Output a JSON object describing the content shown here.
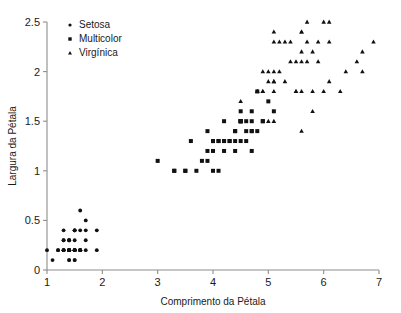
{
  "chart_data": {
    "type": "scatter",
    "title": "",
    "xlabel": "Comprimento da Pétala",
    "ylabel": "Largura da Pétala",
    "xlim": [
      1,
      7
    ],
    "ylim": [
      0,
      2.5
    ],
    "xticks": [
      1,
      2,
      3,
      4,
      5,
      6,
      7
    ],
    "yticks": [
      0,
      0.5,
      1,
      1.5,
      2,
      2.5
    ],
    "xtick_labels": [
      "1",
      "2",
      "3",
      "4",
      "5",
      "6",
      "7"
    ],
    "ytick_labels": [
      "0",
      "0.5",
      "1",
      "1.5",
      "2",
      "2.5"
    ],
    "grid": false,
    "legend_position": "top-left",
    "marker_color": "#111111",
    "axis_color": "#8d8d8d",
    "series": [
      {
        "name": "Setosa",
        "marker": "circle",
        "points": [
          [
            1.4,
            0.2
          ],
          [
            1.4,
            0.2
          ],
          [
            1.3,
            0.2
          ],
          [
            1.5,
            0.2
          ],
          [
            1.4,
            0.2
          ],
          [
            1.7,
            0.4
          ],
          [
            1.4,
            0.3
          ],
          [
            1.5,
            0.2
          ],
          [
            1.4,
            0.2
          ],
          [
            1.5,
            0.1
          ],
          [
            1.5,
            0.2
          ],
          [
            1.6,
            0.2
          ],
          [
            1.4,
            0.1
          ],
          [
            1.1,
            0.1
          ],
          [
            1.2,
            0.2
          ],
          [
            1.5,
            0.4
          ],
          [
            1.3,
            0.4
          ],
          [
            1.4,
            0.3
          ],
          [
            1.7,
            0.3
          ],
          [
            1.5,
            0.3
          ],
          [
            1.7,
            0.2
          ],
          [
            1.5,
            0.4
          ],
          [
            1.0,
            0.2
          ],
          [
            1.7,
            0.5
          ],
          [
            1.9,
            0.2
          ],
          [
            1.6,
            0.2
          ],
          [
            1.6,
            0.4
          ],
          [
            1.5,
            0.2
          ],
          [
            1.4,
            0.2
          ],
          [
            1.6,
            0.2
          ],
          [
            1.6,
            0.2
          ],
          [
            1.5,
            0.4
          ],
          [
            1.5,
            0.1
          ],
          [
            1.4,
            0.2
          ],
          [
            1.5,
            0.2
          ],
          [
            1.2,
            0.2
          ],
          [
            1.3,
            0.2
          ],
          [
            1.4,
            0.1
          ],
          [
            1.3,
            0.2
          ],
          [
            1.5,
            0.2
          ],
          [
            1.3,
            0.3
          ],
          [
            1.3,
            0.3
          ],
          [
            1.3,
            0.2
          ],
          [
            1.6,
            0.6
          ],
          [
            1.9,
            0.4
          ],
          [
            1.4,
            0.3
          ],
          [
            1.6,
            0.2
          ],
          [
            1.4,
            0.2
          ],
          [
            1.5,
            0.2
          ],
          [
            1.4,
            0.2
          ]
        ]
      },
      {
        "name": "Multicolor",
        "marker": "square",
        "points": [
          [
            4.7,
            1.4
          ],
          [
            4.5,
            1.5
          ],
          [
            4.9,
            1.5
          ],
          [
            4.0,
            1.3
          ],
          [
            4.6,
            1.5
          ],
          [
            4.5,
            1.3
          ],
          [
            4.7,
            1.6
          ],
          [
            3.3,
            1.0
          ],
          [
            4.6,
            1.3
          ],
          [
            3.9,
            1.4
          ],
          [
            3.5,
            1.0
          ],
          [
            4.2,
            1.5
          ],
          [
            4.0,
            1.0
          ],
          [
            4.7,
            1.4
          ],
          [
            3.6,
            1.3
          ],
          [
            4.4,
            1.4
          ],
          [
            4.5,
            1.5
          ],
          [
            4.1,
            1.0
          ],
          [
            4.5,
            1.5
          ],
          [
            3.9,
            1.1
          ],
          [
            4.8,
            1.8
          ],
          [
            4.0,
            1.3
          ],
          [
            4.9,
            1.5
          ],
          [
            4.7,
            1.2
          ],
          [
            4.3,
            1.3
          ],
          [
            4.4,
            1.4
          ],
          [
            4.8,
            1.4
          ],
          [
            5.0,
            1.7
          ],
          [
            4.5,
            1.5
          ],
          [
            3.5,
            1.0
          ],
          [
            3.8,
            1.1
          ],
          [
            3.7,
            1.0
          ],
          [
            3.9,
            1.2
          ],
          [
            5.1,
            1.6
          ],
          [
            4.5,
            1.5
          ],
          [
            4.5,
            1.6
          ],
          [
            4.7,
            1.5
          ],
          [
            4.4,
            1.3
          ],
          [
            4.1,
            1.3
          ],
          [
            4.0,
            1.3
          ],
          [
            4.4,
            1.2
          ],
          [
            4.6,
            1.4
          ],
          [
            4.0,
            1.2
          ],
          [
            3.3,
            1.0
          ],
          [
            4.2,
            1.3
          ],
          [
            4.2,
            1.2
          ],
          [
            4.2,
            1.3
          ],
          [
            4.3,
            1.3
          ],
          [
            3.0,
            1.1
          ],
          [
            4.1,
            1.3
          ]
        ]
      },
      {
        "name": "Virgínica",
        "marker": "triangle",
        "points": [
          [
            6.0,
            2.5
          ],
          [
            5.1,
            1.9
          ],
          [
            5.9,
            2.1
          ],
          [
            5.6,
            1.8
          ],
          [
            5.8,
            2.2
          ],
          [
            6.6,
            2.1
          ],
          [
            4.5,
            1.7
          ],
          [
            6.3,
            1.8
          ],
          [
            5.8,
            1.8
          ],
          [
            6.1,
            2.5
          ],
          [
            5.1,
            2.0
          ],
          [
            5.3,
            1.9
          ],
          [
            5.5,
            2.1
          ],
          [
            5.0,
            2.0
          ],
          [
            5.1,
            2.4
          ],
          [
            5.3,
            2.3
          ],
          [
            5.5,
            1.8
          ],
          [
            6.7,
            2.2
          ],
          [
            6.9,
            2.3
          ],
          [
            5.0,
            1.5
          ],
          [
            5.7,
            2.3
          ],
          [
            4.9,
            2.0
          ],
          [
            6.7,
            2.0
          ],
          [
            4.9,
            1.8
          ],
          [
            5.7,
            2.1
          ],
          [
            6.0,
            1.8
          ],
          [
            4.8,
            1.8
          ],
          [
            4.9,
            1.8
          ],
          [
            5.6,
            2.1
          ],
          [
            5.8,
            1.6
          ],
          [
            6.1,
            1.9
          ],
          [
            6.4,
            2.0
          ],
          [
            5.6,
            2.2
          ],
          [
            5.1,
            1.5
          ],
          [
            5.6,
            1.4
          ],
          [
            6.1,
            2.3
          ],
          [
            5.6,
            2.4
          ],
          [
            5.5,
            1.8
          ],
          [
            4.8,
            1.8
          ],
          [
            5.4,
            2.1
          ],
          [
            5.6,
            2.4
          ],
          [
            5.1,
            2.3
          ],
          [
            5.1,
            1.9
          ],
          [
            5.9,
            2.3
          ],
          [
            5.7,
            2.5
          ],
          [
            5.2,
            2.3
          ],
          [
            5.0,
            1.9
          ],
          [
            5.2,
            2.0
          ],
          [
            5.4,
            2.3
          ],
          [
            5.1,
            1.8
          ]
        ]
      }
    ]
  },
  "legend": {
    "entries": [
      {
        "label": "Setosa",
        "marker": "circle"
      },
      {
        "label": "Multicolor",
        "marker": "square"
      },
      {
        "label": "Virgínica",
        "marker": "triangle"
      }
    ]
  }
}
